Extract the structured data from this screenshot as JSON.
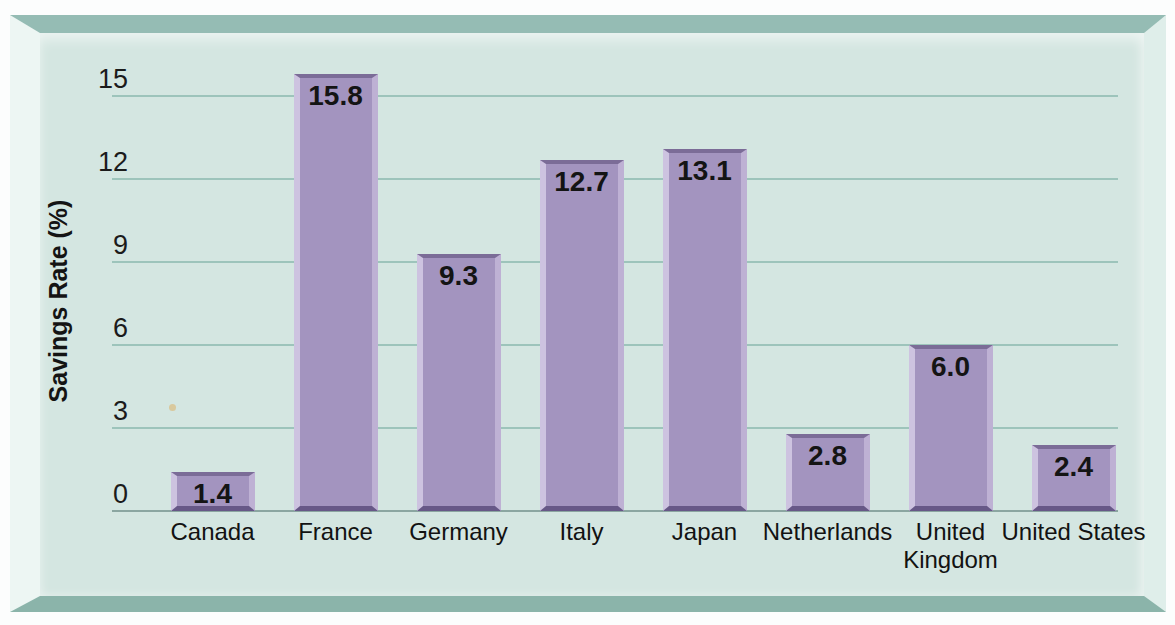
{
  "frame": {
    "top_color": "#95bcb4",
    "bottom_color": "#8bb4aa",
    "left_color": "#edf6f3",
    "right_color": "#dfeeea",
    "panel_color": "#d4e6e1"
  },
  "chart_data": {
    "type": "bar",
    "title": "",
    "categories": [
      "Canada",
      "France",
      "Germany",
      "Italy",
      "Japan",
      "Netherlands",
      "United Kingdom",
      "United States"
    ],
    "values": [
      1.4,
      15.8,
      9.3,
      12.7,
      13.1,
      2.8,
      6.0,
      2.4
    ],
    "value_labels": [
      "1.4",
      "15.8",
      "9.3",
      "12.7",
      "13.1",
      "2.8",
      "6.0",
      "2.4"
    ],
    "xlabel": "",
    "ylabel": "Savings Rate (%)",
    "yticks": [
      0,
      3,
      6,
      9,
      12,
      15
    ],
    "ylim": [
      0,
      16.9
    ],
    "grid": true,
    "legend": "none",
    "bar_color": "#a394bf",
    "bar_edge_light_left": "#cdc3e0",
    "bar_edge_light_right": "#beb1d4",
    "bar_edge_dark_top": "#7b6c97",
    "bar_edge_dark_bottom": "#675887",
    "gridline_color": "#9dc4bb",
    "zero_line_color": "#8ba6a1",
    "text_color": "#141414"
  }
}
